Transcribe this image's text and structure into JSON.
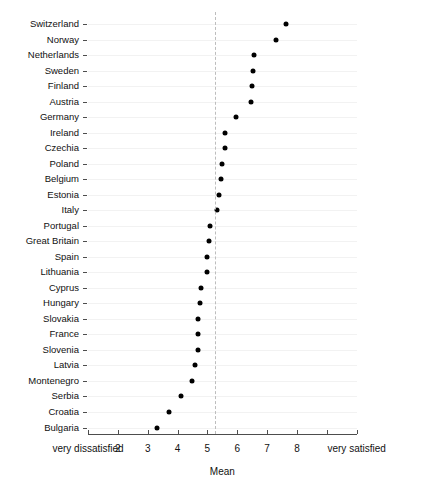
{
  "chart_data": {
    "type": "scatter",
    "title": "",
    "xlabel": "Mean",
    "ylabel": "",
    "xlim": [
      1,
      10
    ],
    "grid": true,
    "legend": null,
    "orientation": "horizontal-dotplot",
    "reference_line": {
      "value": 5.25,
      "style": "dashed",
      "color": "#bdbdbd"
    },
    "x_tick_values": [
      1,
      2,
      3,
      4,
      5,
      6,
      7,
      8,
      9,
      10
    ],
    "x_tick_labels": [
      "very dissatisfied",
      "2",
      "3",
      "4",
      "5",
      "6",
      "7",
      "8",
      "",
      "very satisfied"
    ],
    "categories": [
      "Switzerland",
      "Norway",
      "Netherlands",
      "Sweden",
      "Finland",
      "Austria",
      "Germany",
      "Ireland",
      "Czechia",
      "Poland",
      "Belgium",
      "Estonia",
      "Italy",
      "Portugal",
      "Great Britain",
      "Spain",
      "Lithuania",
      "Cyprus",
      "Hungary",
      "Slovakia",
      "France",
      "Slovenia",
      "Latvia",
      "Montenegro",
      "Serbia",
      "Croatia",
      "Bulgaria"
    ],
    "values": [
      7.63,
      7.3,
      6.55,
      6.53,
      6.5,
      6.47,
      5.95,
      5.6,
      5.58,
      5.5,
      5.47,
      5.4,
      5.33,
      5.1,
      5.07,
      5.0,
      4.97,
      4.77,
      4.75,
      4.7,
      4.67,
      4.67,
      4.6,
      4.5,
      4.1,
      3.7,
      3.3
    ],
    "colors": {
      "dot": "#000000",
      "grid": "#f2f2f2",
      "axis": "#4d4d4d",
      "reference": "#bdbdbd"
    }
  }
}
